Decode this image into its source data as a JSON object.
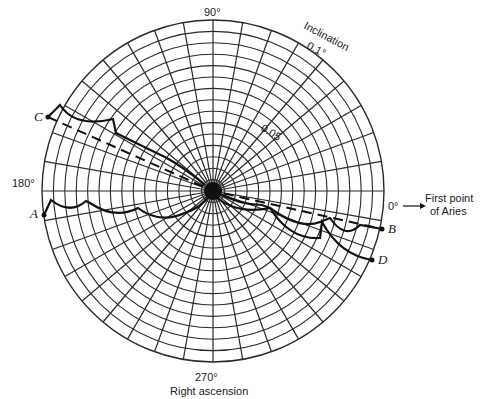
{
  "diagram": {
    "center": {
      "x": 213,
      "y": 191
    },
    "radius": 171,
    "rings": 15,
    "spoke_step_deg": 10,
    "grid_color": "#2a2a2a",
    "curve_color": "#1a1a1a"
  },
  "labels": {
    "angle_90": "90°",
    "angle_180": "180°",
    "angle_0": "0°",
    "angle_270": "270°",
    "inclination_title": "Inclination",
    "inclination_01": "0.1°",
    "inclination_005": "0.05",
    "aries_line1": "First point",
    "aries_line2": "of Aries",
    "right_ascension": "Right ascension"
  },
  "points": {
    "A": "A",
    "B": "B",
    "C": "C",
    "D": "D"
  },
  "curves": [
    {
      "name": "A-to-center",
      "style": "solid",
      "description": "scalloped solid curve from A to center"
    },
    {
      "name": "C-to-center",
      "style": "solid",
      "description": "scalloped solid curve from C to center"
    },
    {
      "name": "C-to-B",
      "style": "dashed",
      "description": "dashed straight line from C through center to B"
    },
    {
      "name": "center-to-B",
      "style": "solid",
      "description": "scalloped solid curve from center to B"
    },
    {
      "name": "center-to-D",
      "style": "solid",
      "description": "scalloped solid curve from center to D"
    }
  ]
}
